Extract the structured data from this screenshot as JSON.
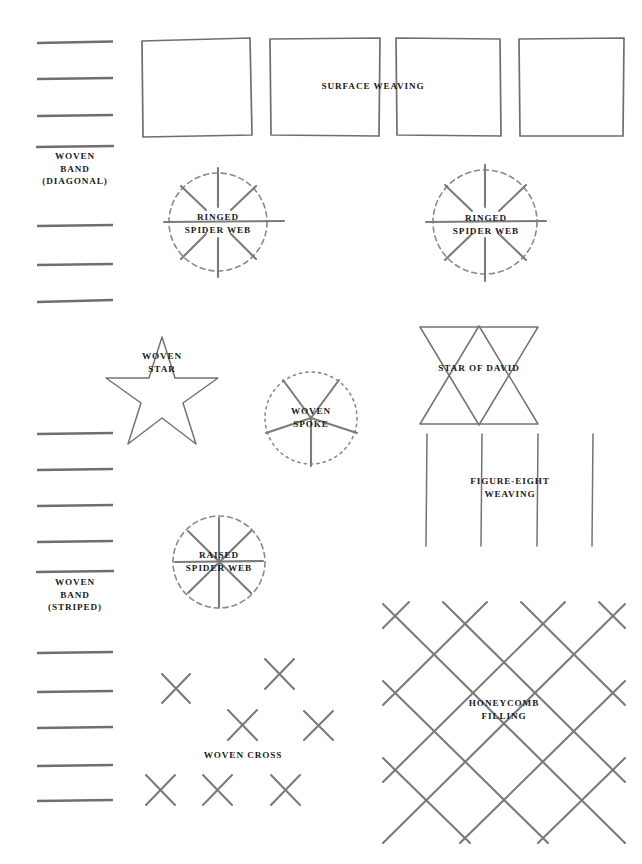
{
  "page": {
    "background_color": "#ffffff",
    "ink_color": "#7b7b7b",
    "text_color": "#1c1c1c",
    "width": 642,
    "height": 864
  },
  "motifs": {
    "woven_band_diagonal": {
      "label": "WOVEN\nBAND\n(DIAGONAL)",
      "icon": "horizontal-band-lines-icon",
      "line_count": 7
    },
    "surface_weaving": {
      "label": "SURFACE WEAVING",
      "icon": "four-squares-icon",
      "square_count": 4
    },
    "ringed_spider_web_left": {
      "label": "RINGED\nSPIDER WEB",
      "icon": "dashed-circle-eight-spokes-icon",
      "spoke_count": 8
    },
    "ringed_spider_web_right": {
      "label": "RINGED\nSPIDER WEB",
      "icon": "dashed-circle-eight-spokes-icon",
      "spoke_count": 8
    },
    "woven_star": {
      "label": "WOVEN\nSTAR",
      "icon": "five-point-star-icon",
      "points": 5
    },
    "star_of_david": {
      "label": "STAR OF DAVID",
      "icon": "six-point-star-icon",
      "points": 6
    },
    "woven_spoke": {
      "label": "WOVEN\nSPOKE",
      "icon": "dotted-circle-five-spokes-icon",
      "spoke_count": 5
    },
    "figure_eight_weaving": {
      "label": "FIGURE-EIGHT\nWEAVING",
      "icon": "four-vertical-lines-icon",
      "line_count": 4
    },
    "raised_spider_web": {
      "label": "RAISED\nSPIDER WEB",
      "icon": "dashed-circle-eight-spokes-icon",
      "spoke_count": 8
    },
    "woven_band_striped": {
      "label": "WOVEN\nBAND\n(STRIPED)",
      "icon": "horizontal-band-lines-icon",
      "line_count": 9
    },
    "woven_cross": {
      "label": "WOVEN CROSS",
      "icon": "scattered-crosses-icon",
      "cross_count": 7
    },
    "honeycomb_filling": {
      "label": "HONEYCOMB\nFILLING",
      "icon": "diagonal-lattice-icon"
    }
  }
}
